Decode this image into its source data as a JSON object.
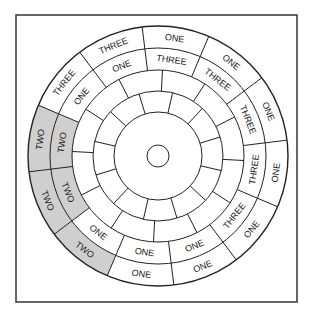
{
  "diagram": {
    "title": "",
    "frame": {
      "x": 16,
      "y": 15,
      "width": 281,
      "height": 287
    },
    "center": {
      "x": 158,
      "y": 156
    },
    "radii": {
      "outer": 130,
      "ring2": 108,
      "ring3": 86,
      "ring4": 65,
      "ring5": 44,
      "hub": 11
    },
    "sector_count": 12,
    "sector_start_angle_deg": -7,
    "colors": {
      "shaded": "#cfcfcf",
      "line": "#222222",
      "background": "#ffffff"
    },
    "sectors": [
      {
        "outer": "ONE",
        "inner": "THREE"
      },
      {
        "outer": "ONE",
        "inner": "THREE"
      },
      {
        "outer": "ONE",
        "inner": "THREE"
      },
      {
        "outer": "ONE",
        "inner": "THREE"
      },
      {
        "outer": "ONE",
        "inner": "THREE"
      },
      {
        "outer": "ONE",
        "inner": "ONE"
      },
      {
        "outer": "ONE",
        "inner": "ONE"
      },
      {
        "outer": "TWO",
        "inner": "ONE"
      },
      {
        "outer": "TWO",
        "inner": "TWO"
      },
      {
        "outer": "TWO",
        "inner": "TWO"
      },
      {
        "outer": "THREE",
        "inner": "ONE"
      },
      {
        "outer": "THREE",
        "inner": "ONE"
      }
    ],
    "shaded_label": "TWO"
  }
}
